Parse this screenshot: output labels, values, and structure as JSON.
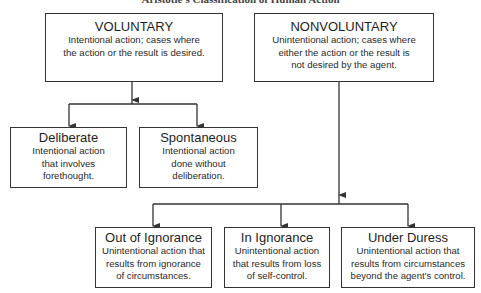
{
  "title": "Aristotle's Classification of Human Action",
  "colors": {
    "line": "#333333",
    "text": "#222222",
    "background": "#ffffff"
  },
  "nodes": {
    "voluntary": {
      "heading": "VOLUNTARY",
      "description": "Intentional action; cases where\nthe action or the result is desired."
    },
    "nonvoluntary": {
      "heading": "NONVOLUNTARY",
      "description": "Unintentional action; cases where\neither the action or the result is\nnot desired by the agent."
    },
    "deliberate": {
      "heading": "Deliberate",
      "description": "Intentional action\nthat involves\nforethought."
    },
    "spontaneous": {
      "heading": "Spontaneous",
      "description": "Intentional action\ndone without\ndeliberation."
    },
    "out_of_ignorance": {
      "heading": "Out of Ignorance",
      "description": "Unintentional action that\nresults from ignorance\nof circumstances."
    },
    "in_ignorance": {
      "heading": "In Ignorance",
      "description": "Unintentional action\nthat results from loss\nof self-control."
    },
    "under_duress": {
      "heading": "Under Duress",
      "description": "Unintentional action that\nresults from circumstances\nbeyond the agent's control."
    }
  },
  "edges": [
    {
      "from": "voluntary",
      "to": "deliberate"
    },
    {
      "from": "voluntary",
      "to": "spontaneous"
    },
    {
      "from": "nonvoluntary",
      "to": "out_of_ignorance"
    },
    {
      "from": "nonvoluntary",
      "to": "in_ignorance"
    },
    {
      "from": "nonvoluntary",
      "to": "under_duress"
    }
  ]
}
